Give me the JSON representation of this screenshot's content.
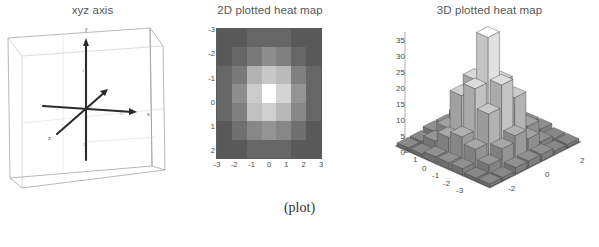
{
  "caption": "(plot)",
  "panels": {
    "xyz": {
      "title": "xyz axis",
      "axis_labels": {
        "x": "x",
        "y": "y",
        "z": "z"
      },
      "tick_labels": [
        "-1",
        "0",
        "1"
      ],
      "description": "3D wireframe bounding box with three crossing axis arrows"
    },
    "heat2d": {
      "title": "2D plotted heat map",
      "xticks": [
        "-3",
        "-2",
        "-1",
        "0",
        "1",
        "2",
        "3"
      ],
      "yticks": [
        "-3",
        "-2",
        "-1",
        "0",
        "1",
        "2"
      ]
    },
    "heat3d": {
      "title": "3D plotted heat map",
      "zticks": [
        "35",
        "30",
        "25",
        "20",
        "15",
        "10",
        "5",
        "0"
      ],
      "left_axis_ticks": [
        "2",
        "1",
        "0",
        "-1",
        "-2",
        "-3"
      ],
      "right_axis_ticks": [
        "-2",
        "0",
        "2"
      ]
    }
  },
  "chart_data": [
    {
      "type": "heatmap",
      "title": "2D plotted heat map",
      "xlabel": "",
      "ylabel": "",
      "xticks": [
        "-3",
        "-2",
        "-1",
        "0",
        "1",
        "2",
        "3"
      ],
      "yticks": [
        "-3",
        "-2",
        "-1",
        "0",
        "1",
        "2"
      ],
      "xlim": [
        -3,
        3
      ],
      "ylim": [
        -3,
        3
      ],
      "grid": false,
      "colormap": "gray",
      "zmin": 0,
      "zmax": 35,
      "row_labels": [
        "-3",
        "-2",
        "-1",
        "0",
        "1",
        "2",
        "3"
      ],
      "col_labels": [
        "-3",
        "-2",
        "-1",
        "0",
        "1",
        "2",
        "3"
      ],
      "values": [
        [
          1,
          1,
          2,
          2,
          2,
          1,
          1
        ],
        [
          1,
          2,
          4,
          7,
          5,
          2,
          1
        ],
        [
          2,
          4,
          14,
          19,
          16,
          5,
          2
        ],
        [
          2,
          7,
          20,
          35,
          22,
          8,
          2
        ],
        [
          2,
          5,
          17,
          21,
          15,
          6,
          2
        ],
        [
          1,
          3,
          6,
          8,
          6,
          3,
          1
        ],
        [
          1,
          1,
          2,
          2,
          2,
          1,
          1
        ]
      ]
    },
    {
      "type": "bar",
      "title": "3D plotted heat map",
      "xlabel": "",
      "ylabel": "",
      "zlabel": "",
      "zlim": [
        0,
        35
      ],
      "zticks": [
        0,
        5,
        10,
        15,
        20,
        25,
        30,
        35
      ],
      "xticks": [
        "-3",
        "-2",
        "-1",
        "0",
        "1",
        "2"
      ],
      "yticks": [
        "-2",
        "0",
        "2"
      ],
      "grid": false,
      "note": "3D bar rendering of the same 7x7 gaussian surface as the 2D heat map",
      "categories": [
        "-3",
        "-2",
        "-1",
        "0",
        "1",
        "2",
        "3"
      ],
      "values": [
        [
          1,
          1,
          2,
          2,
          2,
          1,
          1
        ],
        [
          1,
          2,
          4,
          7,
          5,
          2,
          1
        ],
        [
          2,
          4,
          14,
          19,
          16,
          5,
          2
        ],
        [
          2,
          7,
          20,
          35,
          22,
          8,
          2
        ],
        [
          2,
          5,
          17,
          21,
          15,
          6,
          2
        ],
        [
          1,
          3,
          6,
          8,
          6,
          3,
          1
        ],
        [
          1,
          1,
          2,
          2,
          2,
          1,
          1
        ]
      ]
    }
  ]
}
